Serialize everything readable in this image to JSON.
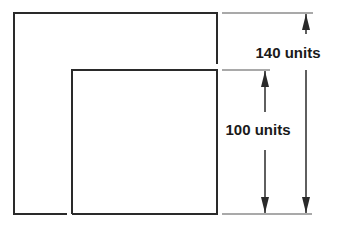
{
  "diagram": {
    "type": "nested-squares-dimension-drawing",
    "line_color": "#2a2a2a",
    "background": "#ffffff",
    "outer_square": {
      "label": "140 units",
      "value": 140,
      "unit": "units"
    },
    "inner_square": {
      "label": "100 units",
      "value": 100,
      "unit": "units"
    }
  }
}
